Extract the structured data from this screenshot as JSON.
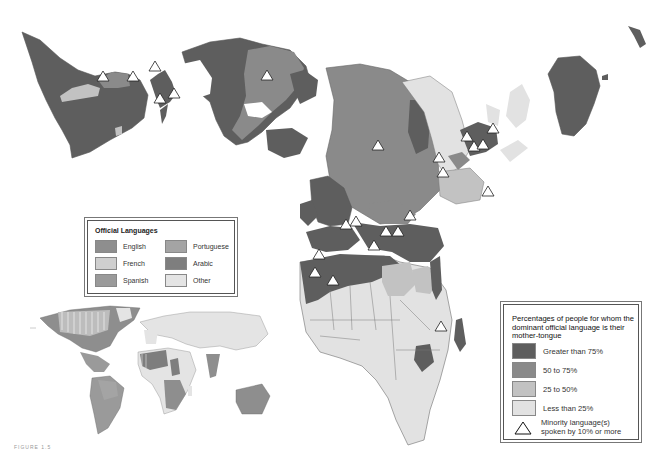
{
  "map": {
    "type": "thematic world map (interrupted projection) with inset",
    "colors": {
      "greater_than_75": "#5e5e5e",
      "p50_to_75": "#8a8a8a",
      "p25_to_50": "#c2c2c2",
      "less_than_25": "#e2e2e2",
      "english": "#8e8e8e",
      "french": "#cfcfcf",
      "spanish": "#9a9a9a",
      "portuguese": "#a4a4a4",
      "arabic": "#7e7e7e",
      "other": "#e4e4e4",
      "ocean": "#ffffff",
      "border": "#6f6f6f"
    },
    "markers": {
      "symbol": "triangle-outline",
      "meaning": "Minority language(s) spoken by 10% or more",
      "approx_positions": [
        [
          103,
          77
        ],
        [
          133,
          76
        ],
        [
          155,
          66
        ],
        [
          160,
          98
        ],
        [
          174,
          93
        ],
        [
          267,
          75
        ],
        [
          378,
          145
        ],
        [
          439,
          157
        ],
        [
          443,
          172
        ],
        [
          467,
          136
        ],
        [
          474,
          146
        ],
        [
          481,
          144
        ],
        [
          493,
          128
        ],
        [
          488,
          191
        ],
        [
          410,
          215
        ],
        [
          346,
          224
        ],
        [
          356,
          221
        ],
        [
          386,
          231
        ],
        [
          398,
          231
        ],
        [
          374,
          245
        ],
        [
          319,
          254
        ],
        [
          315,
          272
        ],
        [
          333,
          280
        ],
        [
          441,
          326
        ]
      ]
    }
  },
  "official_languages_legend": {
    "title": "Official Languages",
    "items": [
      {
        "label": "English",
        "color": "#8e8e8e"
      },
      {
        "label": "Portuguese",
        "color": "#a4a4a4"
      },
      {
        "label": "French",
        "color": "#cfcfcf"
      },
      {
        "label": "Arabic",
        "color": "#7e7e7e"
      },
      {
        "label": "Spanish",
        "color": "#9a9a9a"
      },
      {
        "label": "Other",
        "color": "#e4e4e4"
      }
    ]
  },
  "mother_tongue_legend": {
    "title": "Percentages of people for whom the dominant official language is their mother-tongue",
    "items": [
      {
        "label": "Greater than 75%",
        "color": "#5e5e5e"
      },
      {
        "label": "50 to 75%",
        "color": "#8a8a8a"
      },
      {
        "label": "25 to 50%",
        "color": "#c2c2c2"
      },
      {
        "label": "Less than 25%",
        "color": "#e2e2e2"
      }
    ],
    "triangle_label_line1": "Minority language(s)",
    "triangle_label_line2": "spoken by 10% or more"
  },
  "caption": "FIGURE 1.5"
}
